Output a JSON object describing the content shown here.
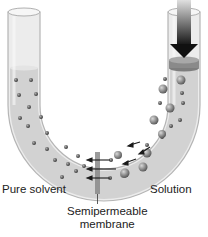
{
  "diagram": {
    "labels": {
      "pure_solvent": "Pure solvent",
      "solution": "Solution",
      "membrane_line1": "Semipermeable",
      "membrane_line2": "membrane"
    },
    "icons": {
      "piston_arrow": "down-arrow-icon",
      "flow_arrows": "left-arrow-icon"
    },
    "colors": {
      "tube_fill": "#d4d4d4",
      "tube_glass": "#e8e8e8",
      "particle": "#555555",
      "membrane": "#7a7a7a",
      "arrow": "#1a1a1a"
    }
  }
}
